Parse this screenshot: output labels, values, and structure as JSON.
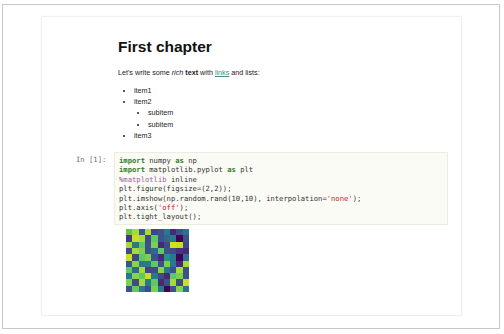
{
  "markdown": {
    "heading": "First chapter",
    "paragraph": {
      "part1": "Let's write some ",
      "italic": "rich",
      "part2": " ",
      "bold": "text",
      "part3": " with ",
      "link": "links",
      "part4": " and lists:"
    },
    "list": {
      "items": [
        "item1",
        "item2",
        "item3"
      ],
      "subitems": [
        "subitem",
        "subitem"
      ]
    },
    "link_color": "#4a8a88"
  },
  "code_cell": {
    "prompt": "In [1]:",
    "lines": [
      {
        "kw1": "import",
        "t1": " numpy ",
        "kw2": "as",
        "t2": " np"
      },
      {
        "kw1": "import",
        "t1": " matplotlib.pyplot ",
        "kw2": "as",
        "t2": " plt"
      },
      {
        "magic": "%matplotlib",
        "rest": " inline"
      },
      {
        "text": "plt.figure(figsize=(2,2));"
      },
      {
        "pre": "plt.imshow(np.random.rand(10,10), interpolation=",
        "str": "'none'",
        "post": ");"
      },
      {
        "pre": "plt.axis(",
        "str": "'off'",
        "post": ");"
      },
      {
        "text": "plt.tight_layout();"
      }
    ]
  },
  "output": {
    "heatmap_colors": [
      [
        "#6bbf45",
        "#a6d93a",
        "#3b5a8c",
        "#a6d93a",
        "#414487",
        "#3b528b",
        "#2a788e",
        "#482878",
        "#3b528b",
        "#2c728e"
      ],
      [
        "#453781",
        "#c8e020",
        "#a6d93a",
        "#3e4a89",
        "#5ec962",
        "#3b528b",
        "#31688e",
        "#2a788e",
        "#440154",
        "#3b528b"
      ],
      [
        "#a6d93a",
        "#2a788e",
        "#5ec962",
        "#3b528b",
        "#7ad151",
        "#482878",
        "#3e4a89",
        "#d2e21b",
        "#c8e020",
        "#3e4a89"
      ],
      [
        "#3e4a89",
        "#a6d93a",
        "#7ad151",
        "#3b528b",
        "#31688e",
        "#5ec962",
        "#3b528b",
        "#3e4a89",
        "#46327e",
        "#482878"
      ],
      [
        "#c8e020",
        "#414487",
        "#5ec962",
        "#7ad151",
        "#3b528b",
        "#482878",
        "#21918c",
        "#2a788e",
        "#440154",
        "#2c728e"
      ],
      [
        "#3b528b",
        "#86d549",
        "#2a788e",
        "#2a788e",
        "#5ec962",
        "#3b528b",
        "#7ad151",
        "#2a788e",
        "#482878",
        "#a6d93a"
      ],
      [
        "#5ec962",
        "#31688e",
        "#a6d93a",
        "#414487",
        "#3e4a89",
        "#86d549",
        "#2a788e",
        "#3b528b",
        "#a6d93a",
        "#3b528b"
      ],
      [
        "#2a788e",
        "#86d549",
        "#5ec962",
        "#c8e020",
        "#2a788e",
        "#3e4a89",
        "#482878",
        "#5ec962",
        "#7ad151",
        "#3b528b"
      ],
      [
        "#7ad151",
        "#3e4a89",
        "#a6d93a",
        "#2a788e",
        "#5ec962",
        "#482878",
        "#3b528b",
        "#a6d93a",
        "#3e4a89",
        "#c8e020"
      ],
      [
        "#3b528b",
        "#5ec962",
        "#2a788e",
        "#3e4a89",
        "#7ad151",
        "#2a788e",
        "#440154",
        "#3b528b",
        "#86d549",
        "#2c728e"
      ]
    ]
  }
}
